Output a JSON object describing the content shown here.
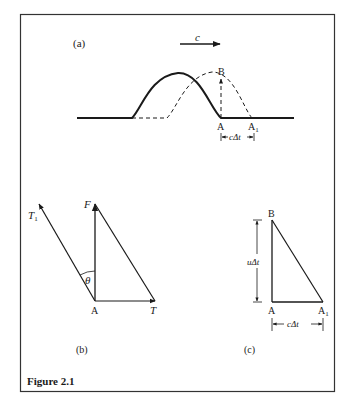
{
  "figure": {
    "caption": "Figure 2.1",
    "colors": {
      "ink": "#1a1a1a",
      "frame": "#333333",
      "background": "#ffffff"
    }
  },
  "panel_a": {
    "label": "(a)",
    "velocity_label": "c",
    "point_b": "B",
    "point_a": "A",
    "point_a1_base": "A",
    "point_a1_sub": "1",
    "dimension_label": "cΔt"
  },
  "panel_b": {
    "label": "(b)",
    "t1_base": "T",
    "t1_sub": "1",
    "f_label": "F",
    "theta_label": "θ",
    "a_label": "A",
    "t_label": "T"
  },
  "panel_c": {
    "label": "(c)",
    "b_label": "B",
    "a_label": "A",
    "a1_base": "A",
    "a1_sub": "1",
    "vertical_dim": "uΔt",
    "horizontal_dim": "cΔt"
  }
}
